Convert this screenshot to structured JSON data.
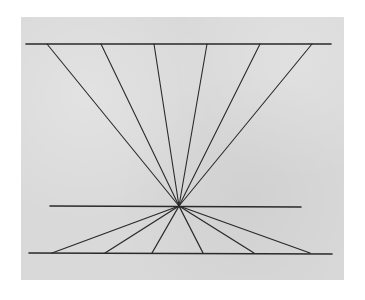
{
  "figure": {
    "background_color": "#d9d9d9",
    "line_color": "#2a2a2a",
    "convergence_point": {
      "x": 179,
      "y": 206
    },
    "horizontal_lines": [
      {
        "id": "top",
        "x1": 26,
        "y1": 44,
        "x2": 331,
        "y2": 44
      },
      {
        "id": "middle",
        "x1": 50,
        "y1": 206,
        "x2": 301,
        "y2": 207
      },
      {
        "id": "bottom",
        "x1": 29,
        "y1": 253,
        "x2": 332,
        "y2": 254
      }
    ],
    "upper_fan_endpoints_x": [
      47,
      101,
      154,
      207,
      260,
      312
    ],
    "upper_fan_y": 44,
    "lower_fan_endpoints_x": [
      52,
      105,
      152,
      203,
      254,
      310
    ],
    "lower_fan_y": 253
  }
}
